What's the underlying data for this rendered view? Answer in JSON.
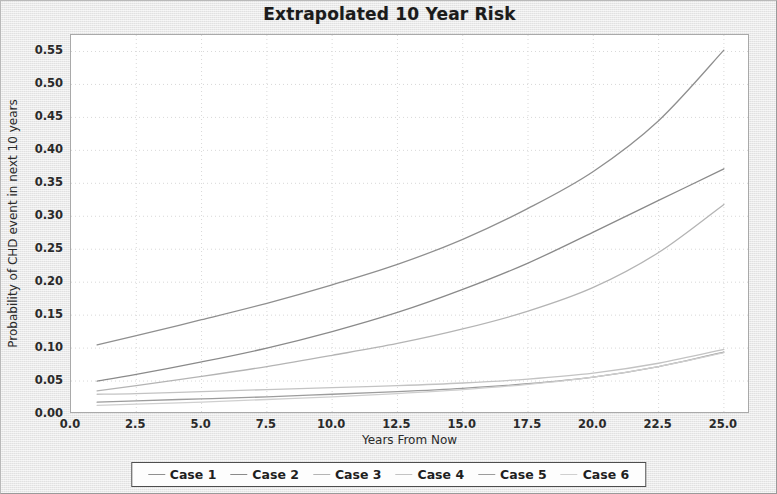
{
  "chart_data": {
    "type": "line",
    "title": "Extrapolated 10 Year Risk",
    "xlabel": "Years From Now",
    "ylabel": "Probability of CHD event in next 10 years",
    "xlim": [
      0.0,
      26.0
    ],
    "ylim": [
      0.0,
      0.575
    ],
    "grid": true,
    "legend_position": "bottom",
    "xticks": [
      "0.0",
      "2.5",
      "5.0",
      "7.5",
      "10.0",
      "12.5",
      "15.0",
      "17.5",
      "20.0",
      "22.5",
      "25.0"
    ],
    "xtick_values": [
      0.0,
      2.5,
      5.0,
      7.5,
      10.0,
      12.5,
      15.0,
      17.5,
      20.0,
      22.5,
      25.0
    ],
    "yticks": [
      "0.00",
      "0.05",
      "0.10",
      "0.15",
      "0.20",
      "0.25",
      "0.30",
      "0.35",
      "0.40",
      "0.45",
      "0.50",
      "0.55"
    ],
    "ytick_values": [
      0.0,
      0.05,
      0.1,
      0.15,
      0.2,
      0.25,
      0.3,
      0.35,
      0.4,
      0.45,
      0.5,
      0.55
    ],
    "x": [
      1,
      2.5,
      5,
      7.5,
      10,
      12.5,
      15,
      17.5,
      20,
      22.5,
      25
    ],
    "series": [
      {
        "name": "Case 1",
        "color": "#8f8f8f",
        "values": [
          0.105,
          0.119,
          0.143,
          0.168,
          0.196,
          0.227,
          0.265,
          0.312,
          0.368,
          0.445,
          0.552
        ]
      },
      {
        "name": "Case 2",
        "color": "#8a8a8a",
        "values": [
          0.05,
          0.06,
          0.079,
          0.1,
          0.125,
          0.154,
          0.189,
          0.229,
          0.276,
          0.324,
          0.372
        ]
      },
      {
        "name": "Case 3",
        "color": "#b4b4b4",
        "values": [
          0.035,
          0.043,
          0.057,
          0.072,
          0.089,
          0.107,
          0.129,
          0.156,
          0.192,
          0.245,
          0.318
        ]
      },
      {
        "name": "Case 4",
        "color": "#c3c3c3",
        "values": [
          0.03,
          0.031,
          0.034,
          0.037,
          0.04,
          0.043,
          0.047,
          0.053,
          0.062,
          0.077,
          0.098
        ]
      },
      {
        "name": "Case 5",
        "color": "#9c9c9c",
        "values": [
          0.018,
          0.02,
          0.023,
          0.026,
          0.03,
          0.034,
          0.039,
          0.046,
          0.056,
          0.072,
          0.094
        ]
      },
      {
        "name": "Case 6",
        "color": "#cfcfcf",
        "values": [
          0.013,
          0.015,
          0.018,
          0.022,
          0.026,
          0.031,
          0.037,
          0.045,
          0.056,
          0.072,
          0.093
        ]
      }
    ]
  },
  "legend": {
    "items": [
      {
        "label": "Case 1"
      },
      {
        "label": "Case 2"
      },
      {
        "label": "Case 3"
      },
      {
        "label": "Case 4"
      },
      {
        "label": "Case 5"
      },
      {
        "label": "Case 6"
      }
    ]
  },
  "colors": {
    "plot_background": "#ffffff",
    "panel_background": "#ebebeb",
    "grid": "#d8d8d8",
    "axis": "#a9a9a9",
    "text": "#2a2a2a",
    "title": "#1b1b1b"
  }
}
